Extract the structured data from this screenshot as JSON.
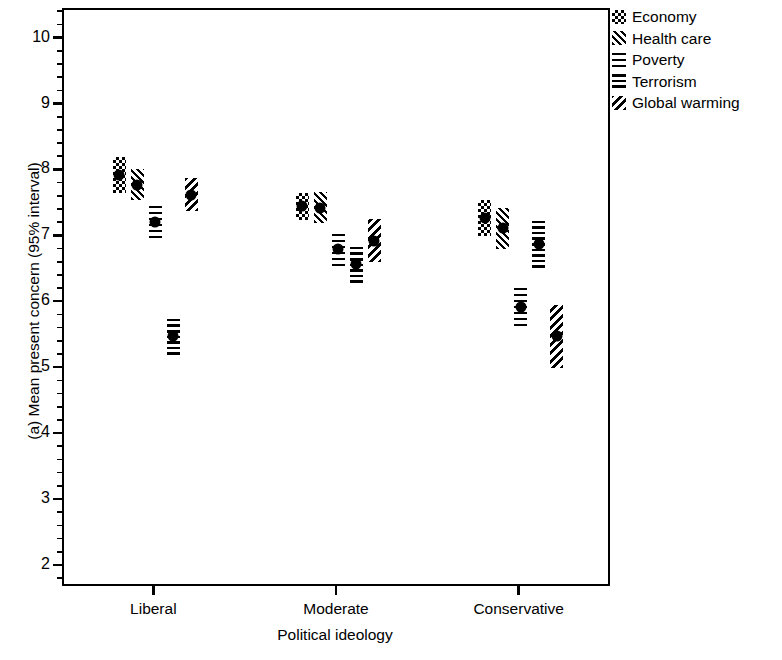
{
  "chart_data": {
    "type": "scatter",
    "title": "",
    "xlabel": "Political ideology",
    "ylabel": "(a) Mean present concern (95% interval)",
    "categories": [
      "Liberal",
      "Moderate",
      "Conservative"
    ],
    "ylim": [
      1.68,
      10.45
    ],
    "yticks": [
      2,
      3,
      4,
      5,
      6,
      7,
      8,
      9,
      10
    ],
    "ytick_labels": [
      "2",
      "3",
      "4",
      "5",
      "6",
      "7",
      "8",
      "9",
      "10"
    ],
    "minor_ticks": true,
    "grid": false,
    "legend_position": "right",
    "series": [
      {
        "name": "Economy",
        "pattern": "checkerboard",
        "values": [
          7.95,
          7.47,
          7.3
        ],
        "ci_low": [
          7.68,
          7.27,
          7.02
        ],
        "ci_high": [
          8.22,
          7.68,
          7.57
        ]
      },
      {
        "name": "Health care",
        "pattern": "diagonal-back",
        "values": [
          7.8,
          7.45,
          7.14
        ],
        "ci_low": [
          7.56,
          7.22,
          6.83
        ],
        "ci_high": [
          8.03,
          7.69,
          7.45
        ]
      },
      {
        "name": "Poverty",
        "pattern": "crosshatch",
        "values": [
          7.24,
          6.82,
          5.95
        ],
        "ci_low": [
          6.99,
          6.57,
          5.66
        ],
        "ci_high": [
          7.49,
          7.07,
          6.24
        ]
      },
      {
        "name": "Terrorism",
        "pattern": "horizontal-lines",
        "values": [
          5.5,
          6.6,
          6.9
        ],
        "ci_low": [
          5.22,
          6.3,
          6.53
        ],
        "ci_high": [
          5.78,
          6.9,
          7.27
        ]
      },
      {
        "name": "Global warming",
        "pattern": "diagonal-forward",
        "values": [
          7.65,
          6.95,
          5.5
        ],
        "ci_low": [
          7.4,
          6.62,
          5.02
        ],
        "ci_high": [
          7.9,
          7.28,
          5.98
        ]
      }
    ]
  },
  "legend": {
    "items": [
      {
        "label": "Economy"
      },
      {
        "label": "Health care"
      },
      {
        "label": "Poverty"
      },
      {
        "label": "Terrorism"
      },
      {
        "label": "Global warming"
      }
    ]
  }
}
